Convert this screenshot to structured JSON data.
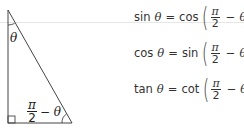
{
  "figure": {
    "triangle": {
      "top_angle_label": "θ",
      "bottom_angle_label": {
        "numerator": "π",
        "denominator": "2",
        "suffix": "− θ"
      }
    },
    "identities": [
      {
        "lhs_fn": "sin",
        "lhs_var": "θ",
        "eq": "=",
        "rhs_fn": "cos",
        "num": "π",
        "den": "2",
        "minus": "−",
        "var": "θ",
        "open": "(",
        "close": ")"
      },
      {
        "lhs_fn": "cos",
        "lhs_var": "θ",
        "eq": "=",
        "rhs_fn": "sin",
        "num": "π",
        "den": "2",
        "minus": "−",
        "var": "θ",
        "open": "(",
        "close": ")"
      },
      {
        "lhs_fn": "tan",
        "lhs_var": "θ",
        "eq": "=",
        "rhs_fn": "cot",
        "num": "π",
        "den": "2",
        "minus": "−",
        "var": "θ",
        "open": "(",
        "close": ")"
      }
    ]
  }
}
